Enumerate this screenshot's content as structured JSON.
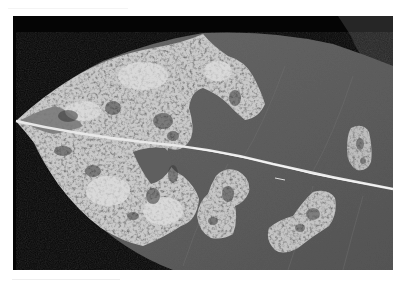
{
  "image": {
    "subject": "Leaf with pale necrotic lesions (grayscale photograph)",
    "style": "grayscale photograph with white margin",
    "colors": {
      "page_background": "#ffffff",
      "photo_background": "#050505",
      "leaf_tissue": "#5e5e5e",
      "lesion_pale": "#c9c9c9",
      "lesion_light": "#dcdcdc",
      "lesion_speckle": "#3a3a3a",
      "midrib": "#e8e8e8",
      "overlapping_leaf": "#262626"
    },
    "regions": [
      {
        "name": "large-lesion-tip",
        "position": "left half, spanning both sides of midrib"
      },
      {
        "name": "lesion-upper-right-lobe",
        "position": "upper center"
      },
      {
        "name": "lesion-lower-center",
        "position": "below midrib, center"
      },
      {
        "name": "lesion-lower-right",
        "position": "below midrib, right"
      },
      {
        "name": "lesion-small-right",
        "position": "above midrib, far right"
      }
    ]
  }
}
